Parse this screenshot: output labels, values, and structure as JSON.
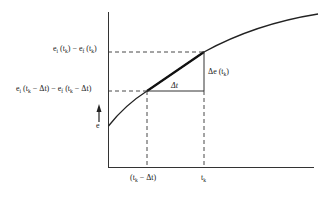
{
  "diagram": {
    "y_axis_label": "e",
    "x_ticks": [
      {
        "base": "(t",
        "sub": "k",
        "rest": " − Δt)"
      },
      {
        "base": "t",
        "sub": "k",
        "rest": ""
      }
    ],
    "y_labels": {
      "upper": {
        "parts": [
          "e",
          "i",
          " (t",
          "k",
          ") − e",
          "f",
          " (t",
          "k",
          ")"
        ]
      },
      "lower": {
        "parts": [
          "e",
          "i",
          " (t",
          "k",
          " − Δt) − e",
          "f",
          " (t",
          "k",
          " − Δt)"
        ]
      }
    },
    "delta_t_label": "Δt",
    "delta_e_label": {
      "base": "Δe (t",
      "sub": "k",
      "rest": ")"
    },
    "colors": {
      "line": "#222222",
      "background": "#ffffff"
    }
  }
}
